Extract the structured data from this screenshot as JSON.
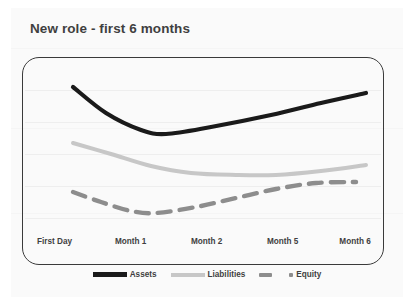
{
  "chart_title": "New role - first 6 months",
  "colors": {
    "assets": "#1a1a1a",
    "liabilities": "#c7c7c7",
    "equity": "#8d8d8d",
    "frame": "#3a3a3a",
    "text": "#3f3f3f",
    "card_background": "#fafafa",
    "gridline": "#eeeeee"
  },
  "legend": {
    "items": [
      {
        "label": "Assets",
        "style": "solid",
        "color": "#1a1a1a"
      },
      {
        "label": "Liabilities",
        "style": "solid",
        "color": "#c7c7c7"
      },
      {
        "label": "Equity",
        "style": "dashed",
        "color": "#8d8d8d"
      }
    ]
  },
  "chart_data": {
    "type": "line",
    "title": "New role - first 6 months",
    "subtitle": "",
    "xlabel": "",
    "ylabel": "",
    "grid": true,
    "legend_position": "bottom",
    "categories": [
      "First Day",
      "Month 1",
      "Month 2",
      "Month 5",
      "Month 6"
    ],
    "x": [
      0,
      1,
      2,
      3,
      4
    ],
    "ylim": [
      0,
      100
    ],
    "axis_ticks_visible": false,
    "series": [
      {
        "name": "Assets",
        "style": "solid",
        "color": "#1a1a1a",
        "values": [
          86,
          63,
          67,
          77,
          83
        ],
        "points": [
          [
            62,
            79
          ],
          [
            95,
            105
          ],
          [
            130,
            122
          ],
          [
            155,
            126
          ],
          [
            200,
            119
          ],
          [
            260,
            107
          ],
          [
            310,
            95
          ],
          [
            355,
            85
          ]
        ]
      },
      {
        "name": "Liabilities",
        "style": "solid",
        "color": "#c7c7c7",
        "values": [
          64,
          52,
          47,
          49,
          55
        ],
        "points": [
          [
            62,
            135
          ],
          [
            100,
            146
          ],
          [
            140,
            158
          ],
          [
            180,
            165
          ],
          [
            225,
            167
          ],
          [
            265,
            167
          ],
          [
            310,
            163
          ],
          [
            355,
            157
          ]
        ]
      },
      {
        "name": "Equity",
        "style": "dashed",
        "color": "#8d8d8d",
        "values": [
          41,
          30,
          33,
          42,
          44
        ],
        "points": [
          [
            62,
            184
          ],
          [
            90,
            194
          ],
          [
            120,
            203
          ],
          [
            145,
            205
          ],
          [
            185,
            199
          ],
          [
            225,
            190
          ],
          [
            265,
            181
          ],
          [
            305,
            175
          ],
          [
            345,
            174
          ]
        ]
      }
    ]
  },
  "x_axis_labels": [
    {
      "label": "First Day",
      "pos_pct": 9
    },
    {
      "label": "Month 1",
      "pos_pct": 30
    },
    {
      "label": "Month 2",
      "pos_pct": 51
    },
    {
      "label": "Month 5",
      "pos_pct": 72
    },
    {
      "label": "Month 6",
      "pos_pct": 92
    }
  ]
}
